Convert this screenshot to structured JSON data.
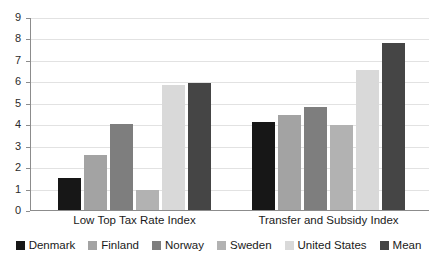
{
  "chart_data": {
    "type": "bar",
    "title": "",
    "subtitle": "",
    "xlabel": "",
    "ylabel": "",
    "categories": [
      "Low Top Tax Rate Index",
      "Transfer and Subsidy Index"
    ],
    "series": [
      {
        "name": "Denmark",
        "color": "#171717",
        "values": [
          1.5,
          4.1
        ]
      },
      {
        "name": "Finland",
        "color": "#a3a3a3",
        "values": [
          2.55,
          4.45
        ]
      },
      {
        "name": "Norway",
        "color": "#7e7e7e",
        "values": [
          4.0,
          4.8
        ]
      },
      {
        "name": "Sweden",
        "color": "#b2b2b2",
        "values": [
          0.93,
          3.95
        ]
      },
      {
        "name": "United States",
        "color": "#d9d9d9",
        "values": [
          5.85,
          6.55
        ]
      },
      {
        "name": "Mean",
        "color": "#454545",
        "values": [
          5.9,
          7.8
        ]
      }
    ],
    "ylim": [
      0,
      9
    ],
    "y_ticks": [
      "0",
      "1",
      "2",
      "3",
      "4",
      "5",
      "6",
      "7",
      "8",
      "9"
    ],
    "grid": true,
    "legend_position": "bottom",
    "axis_color": "#8c8c8c",
    "gridline_color": "#e2e2e2",
    "background": "#ffffff"
  }
}
